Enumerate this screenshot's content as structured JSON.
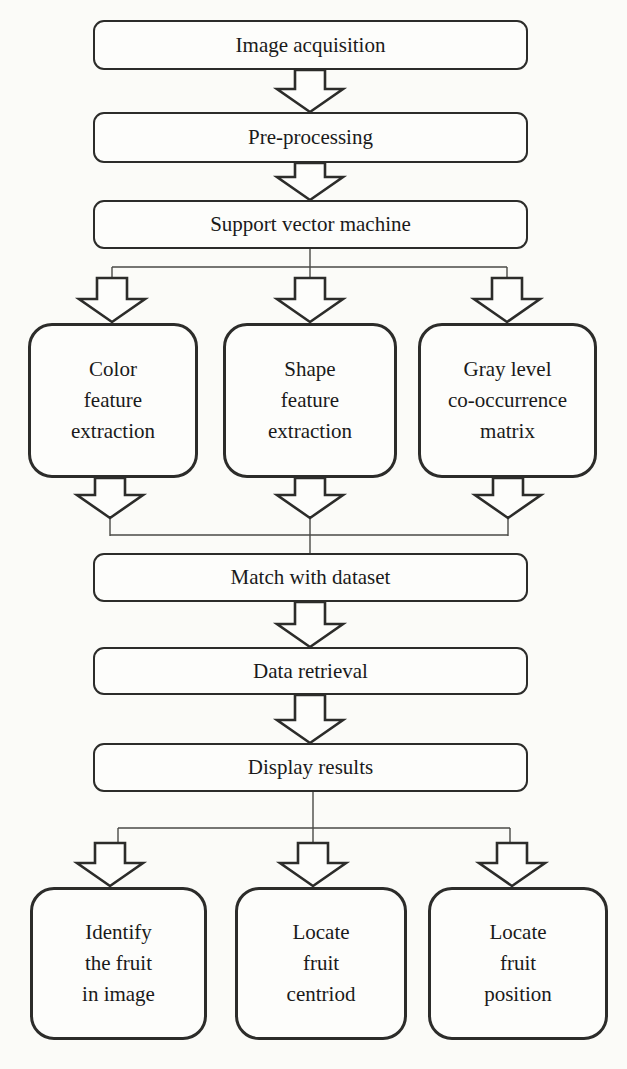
{
  "diagram": {
    "colors": {
      "ink": "#2c2c2a",
      "thin_line": "#4a4a47",
      "paper": "#fbfbf8",
      "text": "#1a1a1a"
    },
    "nodes": {
      "image_acquisition": {
        "label": "Image acquisition"
      },
      "pre_processing": {
        "label": "Pre-processing"
      },
      "svm": {
        "label": "Support vector machine"
      },
      "color_feature": {
        "lines": [
          "Color",
          "feature",
          "extraction"
        ]
      },
      "shape_feature": {
        "lines": [
          "Shape",
          "feature",
          "extraction"
        ]
      },
      "glcm": {
        "lines": [
          "Gray level",
          "co-occurrence",
          "matrix"
        ]
      },
      "match_dataset": {
        "label": "Match with dataset"
      },
      "data_retrieval": {
        "label": "Data retrieval"
      },
      "display_results": {
        "label": "Display results"
      },
      "identify_fruit": {
        "lines": [
          "Identify",
          "the fruit",
          "in image"
        ]
      },
      "locate_centroid": {
        "lines": [
          "Locate",
          "fruit",
          "centriod"
        ]
      },
      "locate_position": {
        "lines": [
          "Locate",
          "fruit",
          "position"
        ]
      }
    },
    "edges": [
      {
        "from": "image_acquisition",
        "to": "pre_processing"
      },
      {
        "from": "pre_processing",
        "to": "svm"
      },
      {
        "from": "svm",
        "to": "color_feature"
      },
      {
        "from": "svm",
        "to": "shape_feature"
      },
      {
        "from": "svm",
        "to": "glcm"
      },
      {
        "from": "color_feature",
        "to": "match_dataset"
      },
      {
        "from": "shape_feature",
        "to": "match_dataset"
      },
      {
        "from": "glcm",
        "to": "match_dataset"
      },
      {
        "from": "match_dataset",
        "to": "data_retrieval"
      },
      {
        "from": "data_retrieval",
        "to": "display_results"
      },
      {
        "from": "display_results",
        "to": "identify_fruit"
      },
      {
        "from": "display_results",
        "to": "locate_centroid"
      },
      {
        "from": "display_results",
        "to": "locate_position"
      }
    ]
  }
}
